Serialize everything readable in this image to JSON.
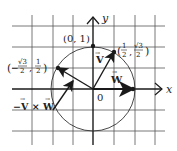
{
  "diagram": {
    "axes": {
      "x_label": "x",
      "y_label": "y",
      "origin_label": "0"
    },
    "points": {
      "top": "(0, 1)",
      "p1": {
        "text": "(½, √3/2)",
        "x": "1",
        "xd": "2",
        "y": "√3",
        "yd": "2"
      },
      "p2": {
        "text": "(−√3/2, ½)",
        "neg": "−",
        "x": "√3",
        "xd": "2",
        "y": "1",
        "yd": "2"
      }
    },
    "vectors": {
      "v": "V",
      "w": "W",
      "cross": "−V × W"
    },
    "colors": {
      "ink": "#1a1a1a",
      "grid": "#555555"
    }
  }
}
